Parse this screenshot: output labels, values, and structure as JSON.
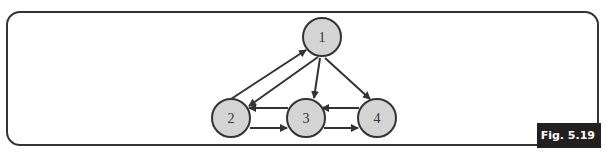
{
  "figure": {
    "label": "Fig. 5.19"
  },
  "graph": {
    "nodes": [
      {
        "id": "1",
        "label": "1",
        "cx": 322,
        "cy": 37
      },
      {
        "id": "2",
        "label": "2",
        "cx": 231,
        "cy": 118
      },
      {
        "id": "3",
        "label": "3",
        "cx": 306,
        "cy": 118
      },
      {
        "id": "4",
        "label": "4",
        "cx": 377,
        "cy": 118
      }
    ],
    "edges": [
      {
        "from": "2",
        "to": "1"
      },
      {
        "from": "1",
        "to": "2"
      },
      {
        "from": "1",
        "to": "3"
      },
      {
        "from": "1",
        "to": "4"
      },
      {
        "from": "3",
        "to": "2"
      },
      {
        "from": "2",
        "to": "3"
      },
      {
        "from": "4",
        "to": "3"
      },
      {
        "from": "3",
        "to": "4"
      }
    ],
    "node_fill": "#d4d4d4",
    "stroke": "#333333"
  }
}
